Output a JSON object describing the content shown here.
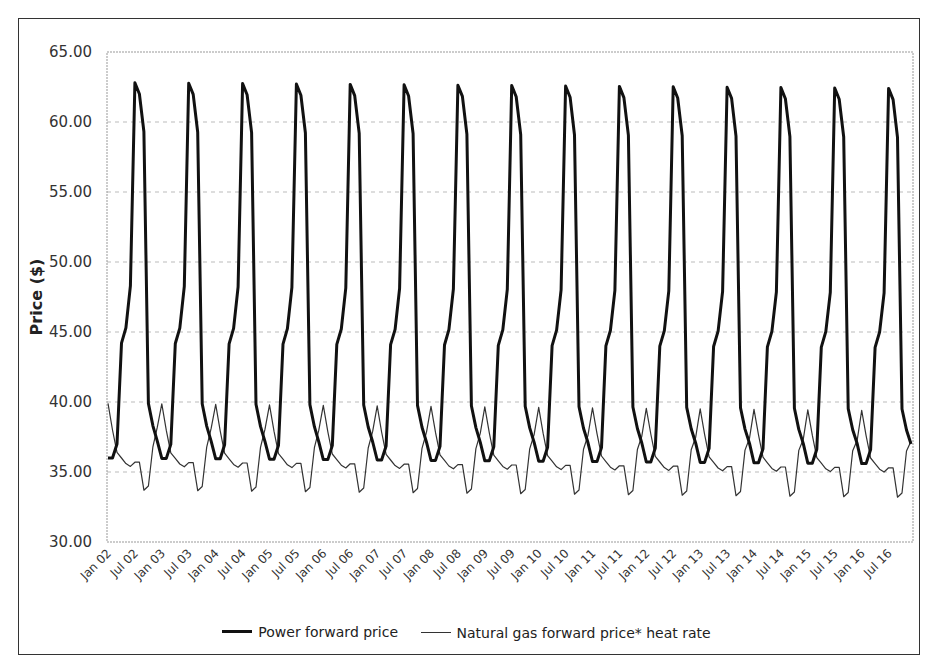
{
  "chart_data": {
    "type": "line",
    "title": "",
    "xlabel": "",
    "ylabel": "Price ($)",
    "ylim": [
      30,
      65
    ],
    "yticks": [
      "30.00",
      "35.00",
      "40.00",
      "45.00",
      "50.00",
      "55.00",
      "60.00",
      "65.00"
    ],
    "ytick_values": [
      30,
      35,
      40,
      45,
      50,
      55,
      60,
      65
    ],
    "xtick_labels": [
      "Jan 02",
      "Jul 02",
      "Jan 03",
      "Jul 03",
      "Jan 04",
      "Jul 04",
      "Jan 05",
      "Jul 05",
      "Jan 06",
      "Jul 06",
      "Jan 07",
      "Jul 07",
      "Jan 08",
      "Jul 08",
      "Jan 09",
      "Jul 09",
      "Jan 10",
      "Jul 10",
      "Jan 11",
      "Jul 11",
      "Jan 12",
      "Jul 12",
      "Jan 13",
      "Jul 13",
      "Jan 14",
      "Jul 14",
      "Jan 15",
      "Jul 15",
      "Jan 16",
      "Jul 16"
    ],
    "grid": "horizontal dashed",
    "legend_position": "bottom",
    "period": "monthly, Jan 2002 - Dec 2016 (repeating annual cycle)",
    "monthly_pattern_months": [
      "Jan",
      "Feb",
      "Mar",
      "Apr",
      "May",
      "Jun",
      "Jul",
      "Aug",
      "Sep",
      "Oct",
      "Nov",
      "Dec"
    ],
    "series": [
      {
        "name": "Power forward price",
        "style": "thick",
        "color": "#111111",
        "annual_pattern": [
          36.0,
          36.0,
          37.0,
          44.2,
          45.3,
          48.3,
          62.8,
          62.0,
          59.3,
          39.9,
          38.3,
          37.2
        ],
        "last_year_pattern": [
          35.6,
          35.6,
          36.6,
          43.9,
          45.0,
          47.8,
          62.4,
          61.6,
          58.9,
          39.5,
          38.0,
          37.0
        ]
      },
      {
        "name": "Natural gas forward price* heat rate",
        "style": "thin",
        "color": "#333333",
        "annual_pattern": [
          39.9,
          38.0,
          36.4,
          36.0,
          35.6,
          35.4,
          35.7,
          35.7,
          33.7,
          34.0,
          36.8,
          38.2
        ],
        "last_year_pattern": [
          39.4,
          37.6,
          36.0,
          35.6,
          35.2,
          35.0,
          35.3,
          35.3,
          33.2,
          33.5,
          36.5,
          37.2
        ]
      }
    ]
  },
  "legend": {
    "power_label": "Power forward price",
    "gas_label": "Natural gas forward price* heat rate"
  },
  "axis": {
    "ylabel": "Price ($)"
  }
}
